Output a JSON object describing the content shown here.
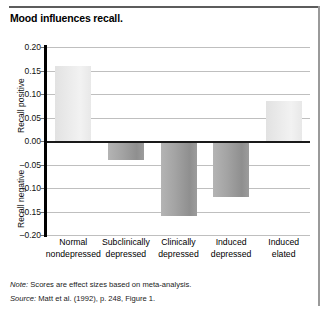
{
  "title": "Mood influences recall.",
  "footer": {
    "note_label": "Note:",
    "note_text": " Scores are effect sizes based on meta-analysis.",
    "source_label": "Source:",
    "source_text": " Matt et al. (1992), p. 248, Figure 1."
  },
  "chart_data": {
    "type": "bar",
    "title": "Mood influences recall.",
    "xlabel": "",
    "ylabel": "",
    "ylabel_positive": "Recall positive",
    "ylabel_negative": "Recall negative",
    "ylim": [
      -0.2,
      0.2
    ],
    "ytick_labels": [
      "0.20",
      "0.15",
      "0.10",
      "0.05",
      "0.00",
      "–0.05",
      "–0.10",
      "–0.15",
      "–0.20"
    ],
    "ytick_values": [
      0.2,
      0.15,
      0.1,
      0.05,
      0.0,
      -0.05,
      -0.1,
      -0.15,
      -0.2
    ],
    "grid": true,
    "legend": "none",
    "categories": [
      "Normal nondepressed",
      "Subclinically depressed",
      "Clinically depressed",
      "Induced depressed",
      "Induced elated"
    ],
    "category_lines": [
      [
        "Normal",
        "nondepressed"
      ],
      [
        "Subclinically",
        "depressed"
      ],
      [
        "Clinically",
        "depressed"
      ],
      [
        "Induced",
        "depressed"
      ],
      [
        "Induced",
        "elated"
      ]
    ],
    "values": [
      0.16,
      -0.04,
      -0.16,
      -0.12,
      0.085
    ],
    "colors": {
      "positive_bar": "#eaeaea",
      "negative_bar": "#a0a0a0",
      "zero_line": "#1a1a1a",
      "gridline": "#bfbfbf",
      "axis": "#000000"
    }
  }
}
